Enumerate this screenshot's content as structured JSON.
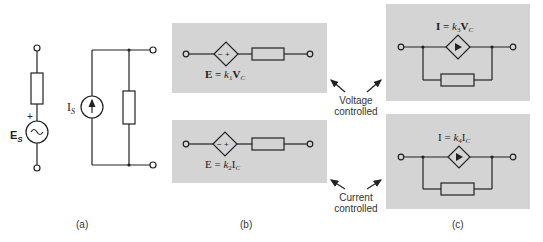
{
  "figure": {
    "panels": {
      "a": {
        "label": "(a)",
        "voltage_source": {
          "symbol": "E",
          "subscript": "S",
          "polarity": "+",
          "glyph": "~"
        },
        "current_source": {
          "symbol": "I",
          "subscript": "S"
        }
      },
      "b": {
        "label": "(b)",
        "top": {
          "eq_lhs": "E = ",
          "k": "k",
          "k_sub": "1",
          "var": "V",
          "var_sub": "C",
          "source_signs": "− +"
        },
        "bottom": {
          "eq_lhs": "E = ",
          "k": "k",
          "k_sub": "2",
          "var": "I",
          "var_sub": "C",
          "source_signs": "− +"
        }
      },
      "c": {
        "label": "(c)",
        "top": {
          "eq_lhs": "I = ",
          "k": "k",
          "k_sub": "3",
          "var": "V",
          "var_sub": "C"
        },
        "bottom": {
          "eq_lhs": "I = ",
          "k": "k",
          "k_sub": "4",
          "var": "I",
          "var_sub": "C"
        }
      }
    },
    "annotations": {
      "voltage": {
        "line1": "Voltage",
        "line2": "controlled"
      },
      "current": {
        "line1": "Current",
        "line2": "controlled"
      }
    },
    "colors": {
      "panel_fill": "#d4d4d4",
      "ink": "#222222"
    }
  }
}
